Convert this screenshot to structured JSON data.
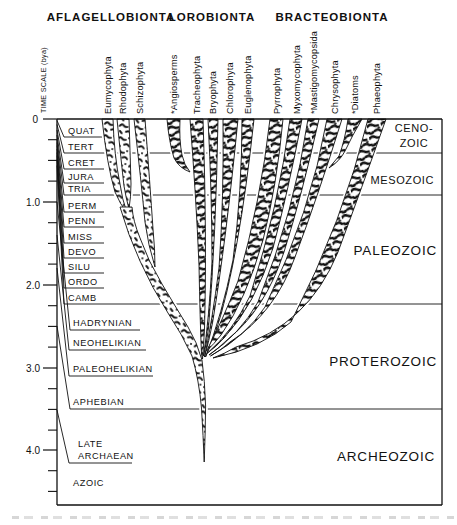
{
  "colors": {
    "ink": "#111111",
    "paper": "#ffffff"
  },
  "axis": {
    "label": "TIME SCALE (bya)",
    "ticks": [
      "0",
      "1.0",
      "2.0",
      "3.0",
      "4.0"
    ]
  },
  "groups": [
    {
      "label": "AFLAGELLOBIONTA",
      "taxa": [
        "Eumycophyta",
        "Rhodophyta",
        "Schizophyta"
      ]
    },
    {
      "label": "LOROBIONTA",
      "taxa": [
        "*Angiosperms",
        "Tracheophyta",
        "Bryophyta",
        "Chlorophyta",
        "Euglenophyta"
      ]
    },
    {
      "label": "BRACTEOBIONTA",
      "taxa": [
        "Pyrrophyta",
        "Myxomycophyta",
        "*Mastigomycopsida",
        "Chrysophyta",
        "*Diatoms",
        "Phaeophyta"
      ]
    }
  ],
  "periods": [
    "QUAT",
    "TERT",
    "CRET",
    "JURA",
    "TRIA",
    "PERM",
    "PENN",
    "MISS",
    "DEVO",
    "SILU",
    "ORDO",
    "CAMB"
  ],
  "precambrian": {
    "intervals": [
      "HADRYNIAN",
      "NEOHELIKIAN",
      "PALEOHELIKIAN",
      "APHEBIAN"
    ],
    "late_archaean": [
      "LATE",
      "ARCHAEAN"
    ],
    "azoic": "AZOIC"
  },
  "eras": {
    "cenozoic": [
      "CENO-",
      "ZOIC"
    ],
    "mesozoic": "MESOZOIC",
    "paleozoic": "PALEOZOIC",
    "proterozoic": "PROTEROZOIC",
    "archeozoic": "ARCHEOZOIC"
  }
}
